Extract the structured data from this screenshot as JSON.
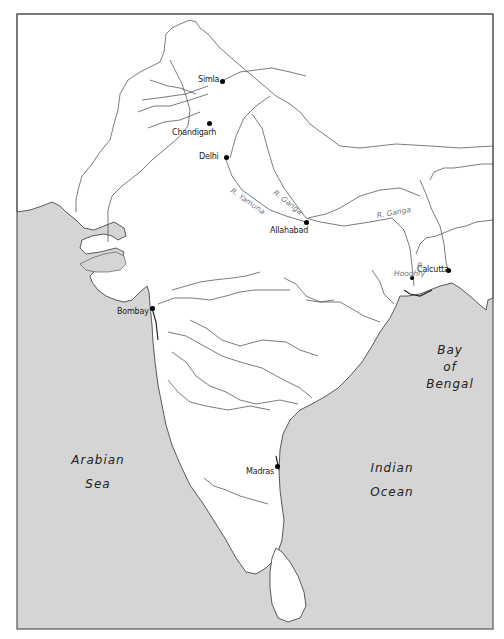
{
  "map": {
    "title": "Map of India and the Indian subcontinent",
    "colors": {
      "sea": "#d5d5d5",
      "land": "#ffffff",
      "border": "#555555",
      "river": "#444444",
      "city_dot": "#000000",
      "river_label": "#777777"
    },
    "cities": [
      {
        "name": "Simla",
        "x": 222,
        "y": 81
      },
      {
        "name": "Chandigarh",
        "x": 209,
        "y": 123
      },
      {
        "name": "Delhi",
        "x": 226,
        "y": 157
      },
      {
        "name": "Allahabad",
        "x": 306,
        "y": 222
      },
      {
        "name": "Calcutta",
        "x": 448,
        "y": 270
      },
      {
        "name": "Bombay",
        "x": 152,
        "y": 308
      },
      {
        "name": "Madras",
        "x": 277,
        "y": 466
      }
    ],
    "river_labels": [
      {
        "name": "R. Yamuna",
        "x": 238,
        "y": 182
      },
      {
        "name": "R. Ganga",
        "x": 279,
        "y": 190
      },
      {
        "name": "R. Ganga",
        "x": 375,
        "y": 212
      },
      {
        "name": "R. Hooghly",
        "x": 408,
        "y": 267
      }
    ],
    "water_bodies": [
      {
        "name_line1": "Bay",
        "name_line2": "of",
        "name_line3": "Bengal"
      },
      {
        "name_line1": "Arabian",
        "name_line2": "Sea"
      },
      {
        "name_line1": "Indian",
        "name_line2": "Ocean"
      }
    ]
  }
}
